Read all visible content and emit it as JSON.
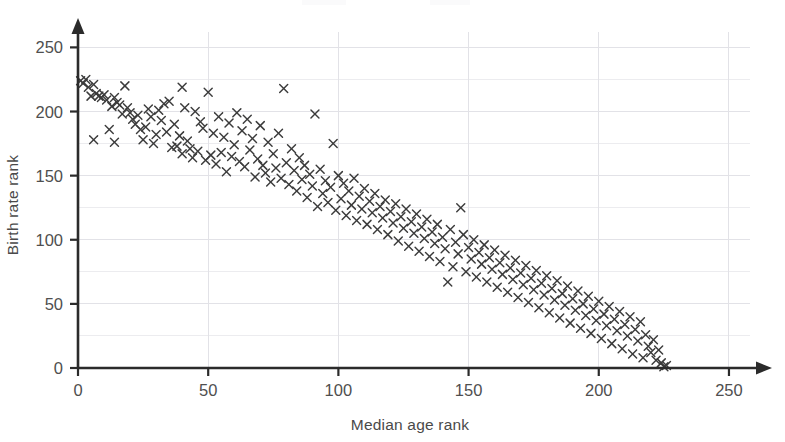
{
  "chart": {
    "type": "scatter",
    "marker_symbol": "x-cross",
    "marker_color": "#3b3b3b",
    "grid_color": "#ececef",
    "axis_color": "#2b2b2b",
    "background": "#ffffff"
  },
  "axes": {
    "x": {
      "label": "Median age rank",
      "min": 0,
      "max": 260,
      "ticks": [
        0,
        50,
        100,
        150,
        200,
        250
      ],
      "tick_labels": [
        "0",
        "50",
        "100",
        "150",
        "200",
        "250"
      ],
      "gridlines": [
        50,
        100,
        150,
        200,
        250
      ],
      "arrow": true
    },
    "y": {
      "label": "Birth rate rank",
      "min": 0,
      "max": 262,
      "ticks": [
        0,
        50,
        100,
        150,
        200,
        250
      ],
      "tick_labels": [
        "0",
        "50",
        "100",
        "150",
        "200",
        "250"
      ],
      "gridlines": [
        25,
        50,
        75,
        100,
        125,
        150,
        175,
        200,
        225,
        250
      ],
      "arrow": true
    }
  },
  "chart_data": {
    "type": "scatter",
    "title": "",
    "subtitle": "",
    "xlabel": "Median age rank",
    "ylabel": "Birth rate rank",
    "xlim": [
      0,
      260
    ],
    "ylim": [
      0,
      262
    ],
    "xticks": [
      0,
      50,
      100,
      150,
      200,
      250
    ],
    "yticks": [
      0,
      50,
      100,
      150,
      200,
      250
    ],
    "grid": true,
    "legend": null,
    "legend_position": "none",
    "marker": "x",
    "n_points": 224,
    "annotations": [],
    "relationship": "strong negative correlation; points form a descending band from about (0, 225) to (225, 0)",
    "points": [
      [
        1,
        224
      ],
      [
        2,
        222
      ],
      [
        3,
        225
      ],
      [
        4,
        219
      ],
      [
        5,
        212
      ],
      [
        6,
        221
      ],
      [
        6,
        178
      ],
      [
        7,
        214
      ],
      [
        8,
        212
      ],
      [
        9,
        211
      ],
      [
        10,
        213
      ],
      [
        11,
        209
      ],
      [
        12,
        186
      ],
      [
        13,
        204
      ],
      [
        14,
        211
      ],
      [
        14,
        176
      ],
      [
        15,
        207
      ],
      [
        16,
        205
      ],
      [
        17,
        198
      ],
      [
        18,
        220
      ],
      [
        19,
        203
      ],
      [
        20,
        199
      ],
      [
        21,
        194
      ],
      [
        22,
        190
      ],
      [
        23,
        197
      ],
      [
        24,
        186
      ],
      [
        25,
        178
      ],
      [
        26,
        188
      ],
      [
        27,
        202
      ],
      [
        28,
        196
      ],
      [
        29,
        175
      ],
      [
        30,
        182
      ],
      [
        31,
        201
      ],
      [
        32,
        193
      ],
      [
        33,
        206
      ],
      [
        34,
        184
      ],
      [
        35,
        208
      ],
      [
        36,
        172
      ],
      [
        37,
        190
      ],
      [
        38,
        173
      ],
      [
        39,
        181
      ],
      [
        40,
        219
      ],
      [
        40,
        167
      ],
      [
        41,
        203
      ],
      [
        42,
        177
      ],
      [
        43,
        171
      ],
      [
        44,
        164
      ],
      [
        45,
        200
      ],
      [
        46,
        169
      ],
      [
        47,
        192
      ],
      [
        48,
        187
      ],
      [
        49,
        162
      ],
      [
        50,
        215
      ],
      [
        51,
        166
      ],
      [
        52,
        183
      ],
      [
        53,
        159
      ],
      [
        54,
        196
      ],
      [
        55,
        168
      ],
      [
        56,
        180
      ],
      [
        57,
        153
      ],
      [
        58,
        191
      ],
      [
        59,
        165
      ],
      [
        60,
        174
      ],
      [
        61,
        199
      ],
      [
        62,
        161
      ],
      [
        63,
        185
      ],
      [
        64,
        157
      ],
      [
        65,
        194
      ],
      [
        66,
        170
      ],
      [
        67,
        179
      ],
      [
        68,
        149
      ],
      [
        69,
        163
      ],
      [
        70,
        189
      ],
      [
        71,
        158
      ],
      [
        72,
        152
      ],
      [
        73,
        176
      ],
      [
        74,
        145
      ],
      [
        75,
        167
      ],
      [
        76,
        156
      ],
      [
        77,
        183
      ],
      [
        78,
        148
      ],
      [
        79,
        218
      ],
      [
        80,
        160
      ],
      [
        81,
        143
      ],
      [
        82,
        171
      ],
      [
        83,
        154
      ],
      [
        84,
        138
      ],
      [
        85,
        164
      ],
      [
        86,
        147
      ],
      [
        87,
        158
      ],
      [
        88,
        133
      ],
      [
        89,
        151
      ],
      [
        90,
        142
      ],
      [
        91,
        198
      ],
      [
        92,
        126
      ],
      [
        93,
        155
      ],
      [
        94,
        136
      ],
      [
        95,
        146
      ],
      [
        96,
        129
      ],
      [
        97,
        141
      ],
      [
        98,
        175
      ],
      [
        99,
        123
      ],
      [
        100,
        150
      ],
      [
        101,
        132
      ],
      [
        102,
        144
      ],
      [
        103,
        119
      ],
      [
        104,
        138
      ],
      [
        105,
        127
      ],
      [
        106,
        148
      ],
      [
        107,
        115
      ],
      [
        108,
        134
      ],
      [
        109,
        124
      ],
      [
        110,
        140
      ],
      [
        111,
        112
      ],
      [
        112,
        130
      ],
      [
        113,
        121
      ],
      [
        114,
        136
      ],
      [
        115,
        108
      ],
      [
        116,
        126
      ],
      [
        117,
        117
      ],
      [
        118,
        131
      ],
      [
        119,
        104
      ],
      [
        120,
        122
      ],
      [
        121,
        113
      ],
      [
        122,
        128
      ],
      [
        123,
        99
      ],
      [
        124,
        118
      ],
      [
        125,
        109
      ],
      [
        126,
        124
      ],
      [
        127,
        95
      ],
      [
        128,
        114
      ],
      [
        129,
        105
      ],
      [
        130,
        120
      ],
      [
        131,
        91
      ],
      [
        132,
        110
      ],
      [
        133,
        101
      ],
      [
        134,
        116
      ],
      [
        135,
        87
      ],
      [
        136,
        106
      ],
      [
        137,
        97
      ],
      [
        138,
        112
      ],
      [
        139,
        83
      ],
      [
        140,
        102
      ],
      [
        141,
        93
      ],
      [
        142,
        67
      ],
      [
        143,
        108
      ],
      [
        144,
        79
      ],
      [
        145,
        98
      ],
      [
        146,
        89
      ],
      [
        147,
        125
      ],
      [
        148,
        104
      ],
      [
        149,
        75
      ],
      [
        150,
        94
      ],
      [
        151,
        85
      ],
      [
        152,
        100
      ],
      [
        153,
        71
      ],
      [
        154,
        90
      ],
      [
        155,
        81
      ],
      [
        156,
        96
      ],
      [
        157,
        67
      ],
      [
        158,
        86
      ],
      [
        159,
        77
      ],
      [
        160,
        92
      ],
      [
        161,
        63
      ],
      [
        162,
        82
      ],
      [
        163,
        73
      ],
      [
        164,
        88
      ],
      [
        165,
        59
      ],
      [
        166,
        78
      ],
      [
        167,
        69
      ],
      [
        168,
        84
      ],
      [
        169,
        55
      ],
      [
        170,
        74
      ],
      [
        171,
        65
      ],
      [
        172,
        80
      ],
      [
        173,
        51
      ],
      [
        174,
        70
      ],
      [
        175,
        61
      ],
      [
        176,
        76
      ],
      [
        177,
        47
      ],
      [
        178,
        66
      ],
      [
        179,
        57
      ],
      [
        180,
        72
      ],
      [
        181,
        43
      ],
      [
        182,
        62
      ],
      [
        183,
        53
      ],
      [
        184,
        68
      ],
      [
        185,
        39
      ],
      [
        186,
        58
      ],
      [
        187,
        49
      ],
      [
        188,
        64
      ],
      [
        189,
        35
      ],
      [
        190,
        54
      ],
      [
        191,
        45
      ],
      [
        192,
        60
      ],
      [
        193,
        31
      ],
      [
        194,
        50
      ],
      [
        195,
        41
      ],
      [
        196,
        56
      ],
      [
        197,
        27
      ],
      [
        198,
        46
      ],
      [
        199,
        37
      ],
      [
        200,
        52
      ],
      [
        201,
        23
      ],
      [
        202,
        42
      ],
      [
        203,
        33
      ],
      [
        204,
        48
      ],
      [
        205,
        19
      ],
      [
        206,
        38
      ],
      [
        207,
        29
      ],
      [
        208,
        44
      ],
      [
        209,
        15
      ],
      [
        210,
        34
      ],
      [
        211,
        25
      ],
      [
        212,
        40
      ],
      [
        213,
        11
      ],
      [
        214,
        30
      ],
      [
        215,
        21
      ],
      [
        216,
        36
      ],
      [
        217,
        8
      ],
      [
        218,
        26
      ],
      [
        219,
        17
      ],
      [
        220,
        12
      ],
      [
        221,
        22
      ],
      [
        222,
        6
      ],
      [
        223,
        14
      ],
      [
        224,
        4
      ],
      [
        225,
        1
      ],
      [
        226,
        2
      ]
    ]
  }
}
